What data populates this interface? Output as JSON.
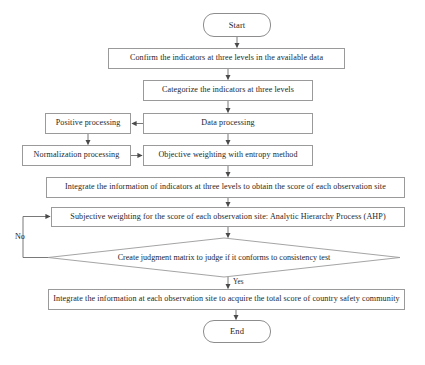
{
  "diagram": {
    "type": "flowchart",
    "orientation": "top-to-bottom",
    "caption": "",
    "colors": {
      "node_border": "#9a9a9a",
      "node_fill": "#ffffff",
      "edge": "#5a5a5a",
      "text": "#262626"
    },
    "nodes": [
      {
        "id": "start",
        "shape": "terminal",
        "label": "Start",
        "x": 203,
        "y": 13,
        "w": 68,
        "h": 24,
        "font": 8.5
      },
      {
        "id": "confirm",
        "shape": "process",
        "label": "Confirm the indicators at three levels in the available data",
        "x": 108,
        "y": 48,
        "w": 237,
        "h": 21,
        "font": 8.1
      },
      {
        "id": "categorize",
        "shape": "process",
        "label": "Categorize the indicators at three levels",
        "x": 143,
        "y": 80,
        "w": 170,
        "h": 21,
        "font": 8.1
      },
      {
        "id": "data-processing",
        "shape": "process",
        "label": "Data processing",
        "x": 143,
        "y": 113,
        "w": 170,
        "h": 21,
        "font": 8.1
      },
      {
        "id": "positive-processing",
        "shape": "process",
        "label": "Positive processing",
        "x": 45,
        "y": 113,
        "w": 86,
        "h": 21,
        "font": 8.1
      },
      {
        "id": "normalization-processing",
        "shape": "process",
        "label": "Normalization processing",
        "x": 22,
        "y": 145,
        "w": 109,
        "h": 21,
        "font": 8.1
      },
      {
        "id": "objective-weighting",
        "shape": "process",
        "label": "Objective weighting with entropy method",
        "x": 143,
        "y": 145,
        "w": 170,
        "h": 21,
        "font": 8.1
      },
      {
        "id": "integrate-indicators",
        "shape": "process",
        "label": "Integrate the information of indicators at three levels to obtain the score of each observation site",
        "x": 46,
        "y": 177,
        "w": 359,
        "h": 21,
        "font": 8.1
      },
      {
        "id": "subjective-weighting",
        "shape": "process",
        "label": "Subjective weighting for the score of each observation site: Analytic Hierarchy Process (AHP)",
        "x": 51,
        "y": 207,
        "w": 354,
        "h": 20,
        "font": 8.1
      },
      {
        "id": "consistency-test",
        "shape": "diamond",
        "label": "Create judgment matrix to judge if it conforms to consistency test",
        "x": 48,
        "y": 238,
        "w": 352,
        "h": 39,
        "font": 8.1
      },
      {
        "id": "integrate-total",
        "shape": "process",
        "label": "Integrate the information at each observation site to acquire the total score of country safety community",
        "x": 48,
        "y": 289,
        "w": 357,
        "h": 21,
        "font": 8.1
      },
      {
        "id": "end",
        "shape": "terminal",
        "label": "End",
        "x": 203,
        "y": 320,
        "w": 68,
        "h": 23,
        "font": 8.5
      }
    ],
    "edge_labels": [
      {
        "id": "no-label",
        "label": "No",
        "x": 15,
        "y": 232,
        "font": 8.1
      },
      {
        "id": "yes-label",
        "label": "Yes",
        "x": 233,
        "y": 278,
        "font": 7.2
      }
    ],
    "edges": [
      {
        "from": "start",
        "to": "confirm",
        "label": ""
      },
      {
        "from": "confirm",
        "to": "categorize",
        "label": ""
      },
      {
        "from": "categorize",
        "to": "data-processing",
        "label": ""
      },
      {
        "from": "data-processing",
        "to": "positive-processing",
        "label": ""
      },
      {
        "from": "positive-processing",
        "to": "normalization-processing",
        "label": ""
      },
      {
        "from": "normalization-processing",
        "to": "objective-weighting",
        "label": ""
      },
      {
        "from": "data-processing",
        "to": "objective-weighting",
        "label": ""
      },
      {
        "from": "objective-weighting",
        "to": "integrate-indicators",
        "label": ""
      },
      {
        "from": "integrate-indicators",
        "to": "subjective-weighting",
        "label": ""
      },
      {
        "from": "subjective-weighting",
        "to": "consistency-test",
        "label": ""
      },
      {
        "from": "consistency-test",
        "to": "subjective-weighting",
        "label": "No"
      },
      {
        "from": "consistency-test",
        "to": "integrate-total",
        "label": "Yes"
      },
      {
        "from": "integrate-total",
        "to": "end",
        "label": ""
      }
    ]
  }
}
